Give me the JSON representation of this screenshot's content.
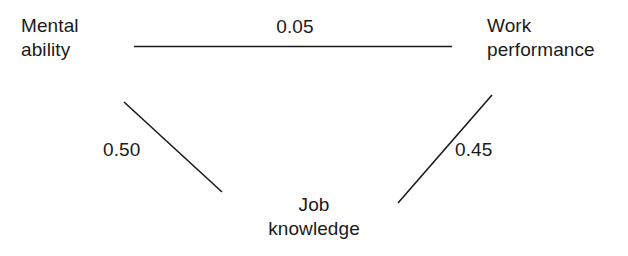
{
  "diagram": {
    "type": "path-analysis-model",
    "background_color": "#ffffff",
    "line_color": "#1a1a1a",
    "text_color": "#1a1a1a",
    "nodes": [
      {
        "id": "mental-ability",
        "label": "Mental\nability"
      },
      {
        "id": "work-performance",
        "label": "Work\nperformance"
      },
      {
        "id": "job-knowledge",
        "label": "Job\nknowledge"
      }
    ],
    "paths": [
      {
        "id": "ability-performance",
        "from": "mental-ability",
        "to": "work-performance",
        "coefficient": "0.05",
        "geometry": {
          "x1": 134,
          "y1": 46,
          "x2": 452,
          "y2": 46
        }
      },
      {
        "id": "ability-knowledge",
        "from": "mental-ability",
        "to": "job-knowledge",
        "coefficient": "0.50",
        "geometry": {
          "x1": 124,
          "y1": 102,
          "x2": 222,
          "y2": 192
        }
      },
      {
        "id": "knowledge-performance",
        "from": "job-knowledge",
        "to": "work-performance",
        "coefficient": "0.45",
        "geometry": {
          "x1": 398,
          "y1": 203,
          "x2": 492,
          "y2": 95
        }
      }
    ]
  }
}
